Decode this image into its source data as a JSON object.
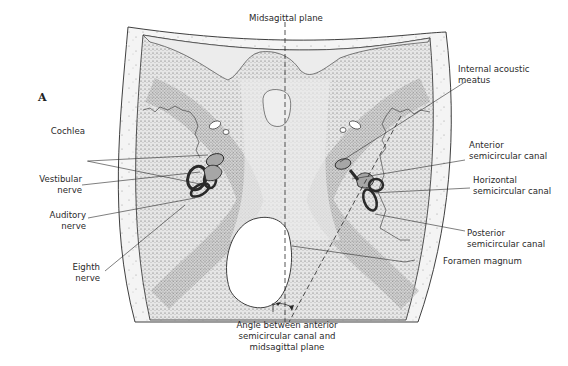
{
  "figure": {
    "panel_label": "A",
    "labels": {
      "midsagittal": "Midsagittal plane",
      "internal_acoustic": [
        "Internal acoustic",
        "meatus"
      ],
      "cochlea": "Cochlea",
      "vestibular": [
        "Vestibular",
        "nerve"
      ],
      "auditory": [
        "Auditory",
        "nerve"
      ],
      "eighth": [
        "Eighth",
        "nerve"
      ],
      "anterior": [
        "Anterior",
        "semicircular canal"
      ],
      "horizontal": [
        "Horizontal",
        "semicircular canal"
      ],
      "posterior": [
        "Posterior",
        "semicircular canal"
      ],
      "foramen": "Foramen magnum",
      "angle": [
        "Angle between anterior",
        "semicircular canal and",
        "midsagittal plane"
      ]
    },
    "colors": {
      "background": "#ffffff",
      "ink": "#2a2a2a",
      "bone_fill": "#d9d9d9",
      "labyrinth_fill": "#9a9a9a"
    }
  }
}
